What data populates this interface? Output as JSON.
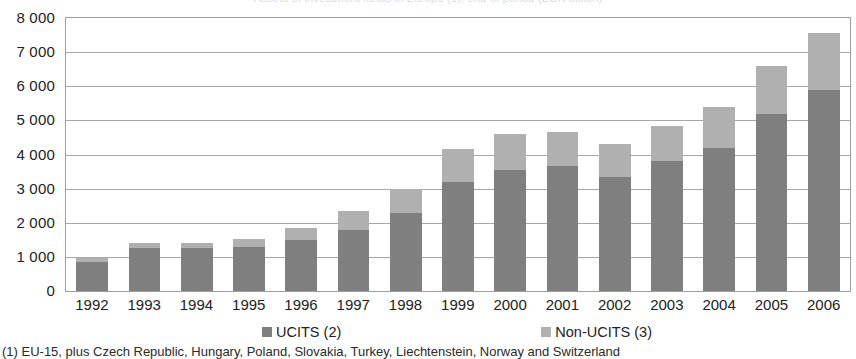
{
  "figure": {
    "title_cropped": "Assets of investment funds in Europe (1), end of period (EUR billion)",
    "footnote": "(1) EU-15, plus Czech Republic, Hungary, Poland, Slovakia, Turkey, Liechtenstein, Norway and Switzerland"
  },
  "colors": {
    "ucits": "#7f7f7f",
    "non_ucits": "#b0b0b0",
    "gridline": "#a8a8a8",
    "axis_border": "#9e9e9e",
    "background": "#ffffff",
    "text": "#222222"
  },
  "legend": {
    "position": "bottom",
    "items": [
      {
        "label": "UCITS (2)",
        "color": "#7f7f7f",
        "swatch": "square-swatch"
      },
      {
        "label": "Non-UCITS (3)",
        "color": "#b0b0b0",
        "swatch": "square-swatch"
      }
    ]
  },
  "chart_data": {
    "type": "bar",
    "stacked": true,
    "title": "Assets of investment funds in Europe (1), end of period (EUR billion)",
    "xlabel": "",
    "ylabel": "",
    "ylim": [
      0,
      8000
    ],
    "ytick_step": 1000,
    "ytick_labels": [
      "8 000",
      "7 000",
      "6 000",
      "5 000",
      "4 000",
      "3 000",
      "2 000",
      "1 000",
      "0"
    ],
    "ytick_values": [
      8000,
      7000,
      6000,
      5000,
      4000,
      3000,
      2000,
      1000,
      0
    ],
    "grid": true,
    "legend_position": "bottom",
    "categories": [
      "1992",
      "1993",
      "1994",
      "1995",
      "1996",
      "1997",
      "1998",
      "1999",
      "2000",
      "2001",
      "2002",
      "2003",
      "2004",
      "2005",
      "2006"
    ],
    "series": [
      {
        "name": "UCITS (2)",
        "color": "#7f7f7f",
        "values": [
          850,
          1250,
          1250,
          1300,
          1500,
          1800,
          2300,
          3200,
          3550,
          3650,
          3350,
          3800,
          4200,
          5200,
          5900
        ]
      },
      {
        "name": "Non-UCITS (3)",
        "color": "#b0b0b0",
        "values": [
          130,
          150,
          170,
          220,
          350,
          550,
          700,
          950,
          1050,
          1000,
          950,
          1050,
          1200,
          1400,
          1650
        ]
      }
    ],
    "totals": [
      980,
      1400,
      1420,
      1520,
      1850,
      2350,
      3000,
      4150,
      4600,
      4650,
      4300,
      4850,
      5400,
      6600,
      7550
    ]
  }
}
